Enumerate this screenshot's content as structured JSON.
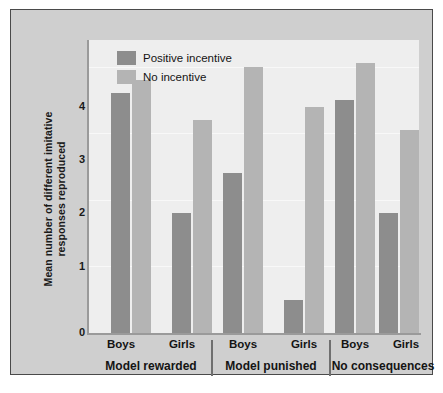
{
  "chart_data": {
    "type": "bar",
    "title": "",
    "xlabel": "",
    "ylabel": "Mean number of different imitative responses reproduced",
    "ylim": [
      0,
      4.4
    ],
    "yticks": [
      0,
      1,
      2,
      3,
      4
    ],
    "ytick_labels": [
      "0",
      "1",
      "2",
      "3",
      "4"
    ],
    "grid": true,
    "legend_position": "top-left",
    "groups": [
      {
        "label": "Model rewarded",
        "subgroups": [
          "Boys",
          "Girls"
        ]
      },
      {
        "label": "Model punished",
        "subgroups": [
          "Boys",
          "Girls"
        ]
      },
      {
        "label": "No consequences",
        "subgroups": [
          "Boys",
          "Girls"
        ]
      }
    ],
    "categories": [
      "Model rewarded / Boys",
      "Model rewarded / Girls",
      "Model punished / Boys",
      "Model punished / Girls",
      "No consequences / Boys",
      "No consequences / Girls"
    ],
    "series": [
      {
        "name": "Positive incentive",
        "color": "#8d8d8d",
        "values": [
          3.6,
          1.8,
          2.4,
          0.5,
          3.5,
          1.8
        ]
      },
      {
        "name": "No incentive",
        "color": "#b4b4b4",
        "values": [
          3.8,
          3.2,
          4.0,
          3.4,
          4.05,
          3.05
        ]
      }
    ]
  },
  "legend": {
    "items": [
      {
        "label": "Positive incentive",
        "color": "#8d8d8d"
      },
      {
        "label": "No incentive",
        "color": "#b4b4b4"
      }
    ]
  },
  "axes": {
    "y_title": "Mean number of different imitative responses reproduced",
    "y_tick_labels": [
      "4",
      "3",
      "2",
      "1",
      "0"
    ]
  },
  "colors": {
    "positive_incentive": "#8d8d8d",
    "no_incentive": "#b4b4b4",
    "panel_background": "#cfcfcf",
    "plot_background": "#eeeeee",
    "axis": "#9a9a9a",
    "border": "#4a4a4a",
    "text": "#141414"
  }
}
